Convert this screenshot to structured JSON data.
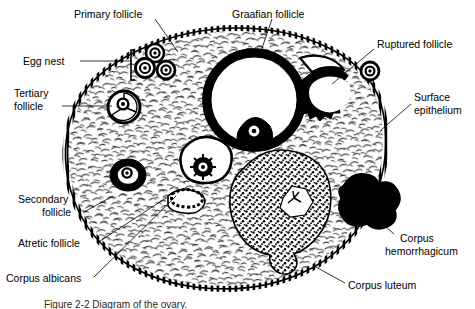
{
  "figure": {
    "caption": "Figure 2-2  Diagram of the ovary.",
    "background_color": "#ffffff",
    "ink_color": "#000000"
  },
  "labels": [
    {
      "id": "primary-follicle",
      "text": "Primary follicle",
      "text_x": 74,
      "text_y": 14,
      "anchor": "start",
      "leader": "M 155 19 L 178 52"
    },
    {
      "id": "egg-nest",
      "text": "Egg nest",
      "text_x": 23,
      "text_y": 64,
      "anchor": "start",
      "leader": "M 80 61 L 132 61"
    },
    {
      "id": "tertiary-follicle",
      "text": "Tertiary",
      "text2": "follicle",
      "text_x": 14,
      "text_y": 96,
      "text2_y": 109,
      "anchor": "start",
      "leader": "M 62 106 L 117 106"
    },
    {
      "id": "secondary-follicle",
      "text": "Secondary",
      "text2": "follicle",
      "text_x": 18,
      "text_y": 202,
      "text2_y": 215,
      "anchor": "start",
      "leader": "M 84 212 L 112 197"
    },
    {
      "id": "atretic-follicle",
      "text": "Atretic follicle",
      "text_x": 18,
      "text_y": 246,
      "anchor": "start",
      "leader": "M 97 243 L 152 150"
    },
    {
      "id": "corpus-albicans",
      "text": "Corpus albicans",
      "text_x": 6,
      "text_y": 281,
      "anchor": "start",
      "leader": "M 94 277 L 176 196"
    },
    {
      "id": "graafian-follicle",
      "text": "Graafian follicle",
      "text_x": 232,
      "text_y": 14,
      "anchor": "start",
      "leader": "M 272 19 L 259 57"
    },
    {
      "id": "ruptured-follicle",
      "text": "Ruptured follicle",
      "text_x": 376,
      "text_y": 45,
      "anchor": "start",
      "leader": "M 374 49 L 337 82"
    },
    {
      "id": "surface-epithelium",
      "text": "Surface",
      "text2": "epithelium",
      "text_x": 414,
      "text_y": 99,
      "text2_y": 112,
      "anchor": "start",
      "leader": "M 411 104 L 383 129"
    },
    {
      "id": "corpus-hemorrhagicum",
      "text": "Corpus",
      "text2": "hemorrhagicum",
      "text_x": 396,
      "text_y": 240,
      "text2_y": 253,
      "anchor": "start",
      "leader": "M 394 234 L 370 212"
    },
    {
      "id": "corpus-luteum",
      "text": "Corpus luteum",
      "text_x": 348,
      "text_y": 288,
      "anchor": "start",
      "leader": "M 345 283 L 316 267"
    }
  ],
  "structures": {
    "ovary_outline": "large oval stroma with hatched surface epithelium",
    "egg_nest_count": 3,
    "graafian_follicle": "large antral follicle with thick dark theca and oocyte",
    "ruptured_follicle": "crater with jagged dark rim",
    "released_ovum": "small ovum outside the ovary",
    "corpus_luteum": "large stippled body with star-shaped white core",
    "corpus_hemorrhagicum": "solid black lobed mass",
    "tertiary_follicle": "antral follicle with dark ring",
    "secondary_follicle": "follicle with dark granulosa layer",
    "atretic_follicle": "collapsed elongated follicle",
    "corpus_albicans": "small pale scar body"
  }
}
